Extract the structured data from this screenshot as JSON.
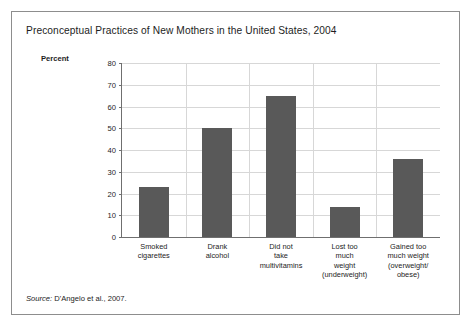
{
  "figure": {
    "title": "Preconceptual Practices of New Mothers in the United States, 2004",
    "source_lead": "Source:",
    "source_text": " D'Angelo et al., 2007."
  },
  "chart_data": {
    "type": "bar",
    "title": "Preconceptual Practices of New Mothers in the United States, 2004",
    "xlabel": "",
    "ylabel": "Percent",
    "ylim": [
      0,
      80
    ],
    "yticks": [
      0,
      10,
      20,
      30,
      40,
      50,
      60,
      70,
      80
    ],
    "grid": true,
    "legend": "none",
    "bar_color": "#595959",
    "categories": [
      "Smoked cigarettes",
      "Drank alcohol",
      "Did not take multivitamins",
      "Lost too much weight (underweight)",
      "Gained too much weight (overweight/ obese)"
    ],
    "category_lines": [
      [
        "Smoked",
        "cigarettes"
      ],
      [
        "Drank",
        "alcohol"
      ],
      [
        "Did not",
        "take",
        "multivitamins"
      ],
      [
        "Lost too",
        "much",
        "weight",
        "(underweight)"
      ],
      [
        "Gained too",
        "much weight",
        "(overweight/",
        "obese)"
      ]
    ],
    "values": [
      23,
      50,
      65,
      14,
      36
    ]
  }
}
